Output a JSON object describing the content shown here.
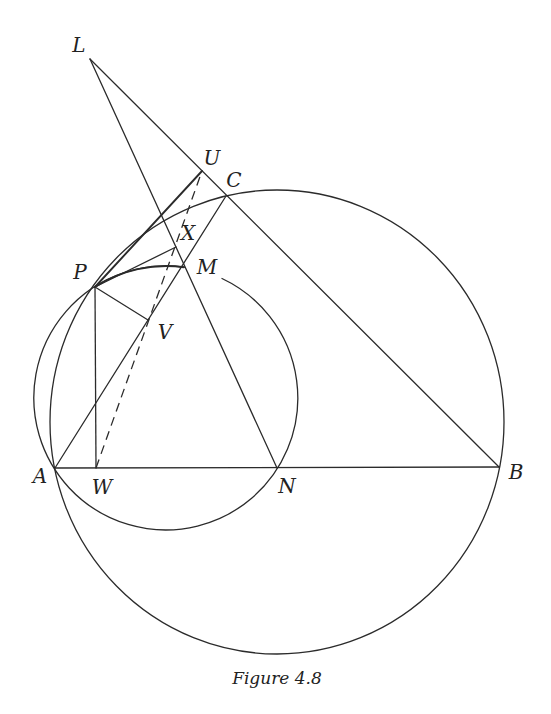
{
  "figure": {
    "caption": "Figure 4.8",
    "points": {
      "L": "L",
      "U": "U",
      "C": "C",
      "X": "X",
      "M": "M",
      "P": "P",
      "V": "V",
      "A": "A",
      "W": "W",
      "N": "N",
      "B": "B"
    },
    "segments": [
      "LB",
      "LN",
      "AC",
      "AB",
      "PU",
      "PW",
      "PV",
      "PX"
    ],
    "dashed_segments": [
      "WU"
    ],
    "circles": [
      "circle through A, P, C, B",
      "circle through A, P, M, N"
    ],
    "arcs": [
      "PM (emphasized)"
    ]
  }
}
